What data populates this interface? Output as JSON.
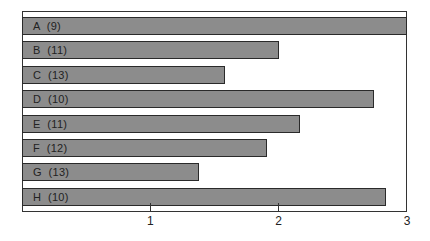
{
  "chart_data": {
    "type": "bar",
    "orientation": "horizontal",
    "title": "",
    "xlabel": "",
    "ylabel": "",
    "categories": [
      "A (9)",
      "B (11)",
      "C (13)",
      "D (10)",
      "E (11)",
      "F (12)",
      "G (13)",
      "H (10)"
    ],
    "values": [
      3.0,
      2.0,
      1.58,
      2.74,
      2.17,
      1.91,
      1.38,
      2.84
    ],
    "xlim": [
      0,
      3
    ],
    "xticks": [
      "1",
      "2",
      "3"
    ],
    "grid": false,
    "legend": null,
    "colors": {
      "bar_fill": "#8c8c8c",
      "bar_edge": "#2a2a2a",
      "axis": "#333333"
    }
  }
}
